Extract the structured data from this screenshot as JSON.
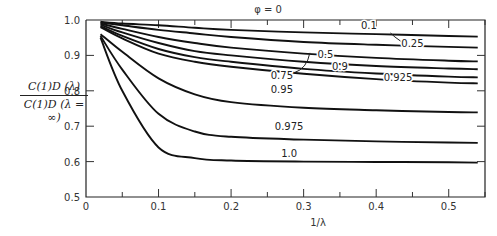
{
  "chart_data": {
    "type": "line",
    "title": "φ = 0",
    "xlabel": "1/λ",
    "ylabel": "C_D^(1)(λ) / C_D^(1)(λ = ∞)",
    "ylabel_numerator": "C(1)D (λ)",
    "ylabel_denominator": "C(1)D (λ = ∞)",
    "xlim": [
      0,
      0.55
    ],
    "ylim": [
      0.5,
      1.0
    ],
    "x_ticks": [
      "0",
      "0.1",
      "0.2",
      "0.3",
      "0.4",
      "0.5"
    ],
    "y_ticks": [
      "0.5",
      "0.6",
      "0.7",
      "0.8",
      "0.9",
      "1.0"
    ],
    "grid": false,
    "legend": "inline curve labels",
    "x": [
      0.02,
      0.05,
      0.1,
      0.15,
      0.2,
      0.3,
      0.4,
      0.5,
      0.54
    ],
    "series": [
      {
        "name": "0.1",
        "values": [
          0.995,
          0.99,
          0.985,
          0.978,
          0.972,
          0.965,
          0.96,
          0.955,
          0.953
        ]
      },
      {
        "name": "0.25",
        "values": [
          0.993,
          0.985,
          0.972,
          0.962,
          0.952,
          0.938,
          0.93,
          0.924,
          0.922
        ]
      },
      {
        "name": "0.5",
        "values": [
          0.99,
          0.975,
          0.952,
          0.935,
          0.922,
          0.905,
          0.893,
          0.885,
          0.883
        ]
      },
      {
        "name": "0.75",
        "values": [
          0.987,
          0.965,
          0.935,
          0.912,
          0.9,
          0.882,
          0.87,
          0.863,
          0.861
        ]
      },
      {
        "name": "0.9",
        "values": [
          0.983,
          0.955,
          0.918,
          0.895,
          0.882,
          0.862,
          0.849,
          0.84,
          0.838
        ]
      },
      {
        "name": "0.925",
        "values": [
          0.98,
          0.948,
          0.905,
          0.882,
          0.868,
          0.848,
          0.833,
          0.823,
          0.821
        ]
      },
      {
        "name": "0.95",
        "values": [
          0.96,
          0.91,
          0.835,
          0.79,
          0.768,
          0.752,
          0.745,
          0.74,
          0.739
        ]
      },
      {
        "name": "0.975",
        "values": [
          0.955,
          0.86,
          0.735,
          0.685,
          0.67,
          0.662,
          0.657,
          0.654,
          0.653
        ]
      },
      {
        "name": "1.0",
        "values": [
          0.95,
          0.8,
          0.64,
          0.61,
          0.603,
          0.6,
          0.599,
          0.598,
          0.597
        ]
      }
    ],
    "annotations": [
      {
        "text": "0.1",
        "x": 0.39,
        "y": 0.985
      },
      {
        "text": "0.25",
        "x": 0.45,
        "y": 0.935,
        "leader": true
      },
      {
        "text": "0.5",
        "x": 0.33,
        "y": 0.905
      },
      {
        "text": "0.9",
        "x": 0.35,
        "y": 0.87
      },
      {
        "text": "0.75",
        "x": 0.27,
        "y": 0.845,
        "leader": true
      },
      {
        "text": "0.925",
        "x": 0.43,
        "y": 0.838
      },
      {
        "text": "0.95",
        "x": 0.27,
        "y": 0.805
      },
      {
        "text": "0.975",
        "x": 0.28,
        "y": 0.7
      },
      {
        "text": "1.0",
        "x": 0.28,
        "y": 0.625
      }
    ]
  }
}
